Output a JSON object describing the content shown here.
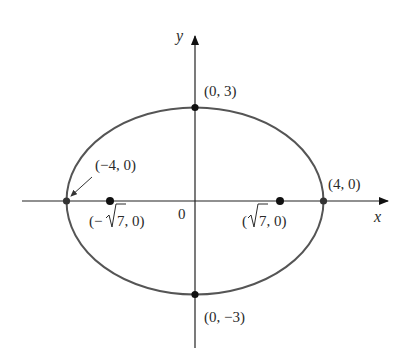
{
  "diagram": {
    "type": "ellipse-plot",
    "equation_params": {
      "a": 4,
      "b": 3,
      "c": "sqrt(7)"
    },
    "axes": {
      "x_label": "x",
      "y_label": "y",
      "origin_label": "0"
    },
    "points": {
      "top_vertex": "(0, 3)",
      "bottom_vertex": "(0, −3)",
      "left_vertex": "(−4, 0)",
      "right_vertex": "(4, 0)",
      "left_focus_prefix": "(−",
      "left_focus_radicand": "7",
      "left_focus_suffix": ", 0)",
      "right_focus_prefix": "(",
      "right_focus_radicand": "7",
      "right_focus_suffix": ", 0)"
    },
    "colors": {
      "curve": "#555555",
      "axis": "#222222",
      "point": "#111111"
    }
  }
}
